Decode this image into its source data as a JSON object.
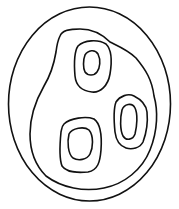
{
  "diagram": {
    "type": "nested closed curves",
    "stroke_color": "#111111",
    "background": "#ffffff",
    "shapes": [
      {
        "name": "outer-ellipse"
      },
      {
        "name": "inner-region"
      },
      {
        "name": "top-loop-outer"
      },
      {
        "name": "top-loop-inner"
      },
      {
        "name": "right-loop-outer"
      },
      {
        "name": "right-loop-inner"
      },
      {
        "name": "bottom-loop-outer"
      },
      {
        "name": "bottom-loop-inner"
      }
    ]
  }
}
